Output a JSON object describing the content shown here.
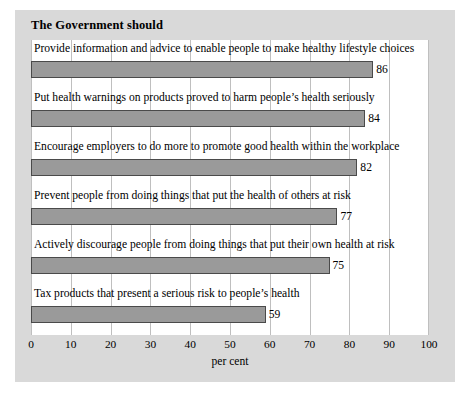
{
  "chart_data": {
    "type": "bar",
    "orientation": "horizontal",
    "title": "The Government should",
    "xlabel": "per cent",
    "ylabel": "",
    "xlim": [
      0,
      100
    ],
    "xticks": [
      0,
      10,
      20,
      30,
      40,
      50,
      60,
      70,
      80,
      90,
      100
    ],
    "grid": "vertical",
    "legend": "none",
    "categories": [
      "Provide information and advice to enable people to make healthy lifestyle choices",
      "Put health warnings on products proved to harm people’s health seriously",
      "Encourage employers to do more to promote good health within the workplace",
      "Prevent people from doing things that put the health of others at risk",
      "Actively discourage people from doing things that put their own health at risk",
      "Tax products that present a serious risk to people’s health"
    ],
    "values": [
      86,
      84,
      82,
      77,
      75,
      59
    ],
    "value_labels": [
      "86",
      "84",
      "82",
      "77",
      "75",
      "59"
    ],
    "colors": {
      "bar_fill": "#9a9a9a",
      "bar_edge": "#4a4a4a",
      "panel_background": "#d9d9d9",
      "plot_background": "#ffffff",
      "gridline": "#bfbfbf",
      "text": "#000000"
    }
  }
}
